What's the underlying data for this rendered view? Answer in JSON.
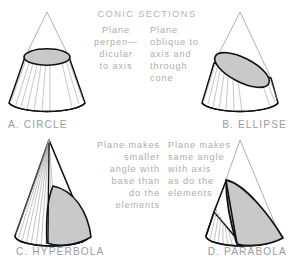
{
  "figure": {
    "title": "CONIC SECTIONS",
    "colors": {
      "background": "#ffffff",
      "cut_fill": "#c9c9c9",
      "outline": "#111111",
      "thin_line": "#8c8c8c",
      "element_line": "#9a9a9a",
      "text": "#a8a8a8"
    }
  },
  "panels": [
    {
      "id": "circle",
      "caption": "A. CIRCLE",
      "note_align": "center",
      "note_lines": [
        "Plane",
        "perpen—",
        "dicular",
        "to axis"
      ],
      "section_shape": "horizontal-ellipse"
    },
    {
      "id": "ellipse",
      "caption": "B. ELLIPSE",
      "note_align": "left",
      "note_lines": [
        "Plane",
        "oblique to",
        "axis and",
        "through",
        "cone"
      ],
      "section_shape": "tilted-ellipse"
    },
    {
      "id": "hyperbola",
      "caption": "C. HYPERBOLA",
      "note_align": "right",
      "note_lines": [
        "Plane makes",
        "smaller",
        "angle with",
        "base than",
        "do the",
        "elements"
      ],
      "section_shape": "hyperbolic-arc"
    },
    {
      "id": "parabola",
      "caption": "D. PARABOLA",
      "note_align": "left",
      "note_lines": [
        "Plane makes",
        "same angle",
        "with axis",
        "as do the",
        "elements"
      ],
      "section_shape": "parabolic-arc"
    }
  ]
}
